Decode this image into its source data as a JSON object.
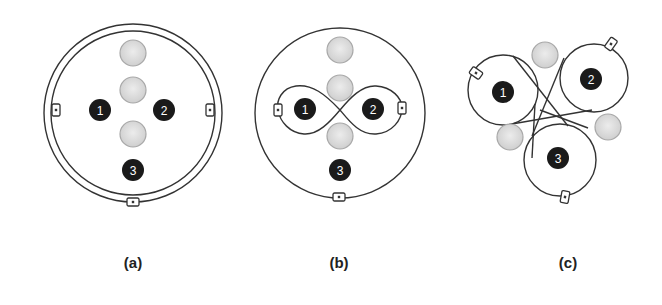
{
  "figure": {
    "panels": [
      {
        "id": "a",
        "caption": "(a)",
        "caption_pos": [
          133,
          262
        ],
        "outer_ring": {
          "cx": 133,
          "cy": 113,
          "r_outer": 89,
          "r_inner": 82
        },
        "gray_circles": [
          [
            133,
            53
          ],
          [
            133,
            90
          ],
          [
            133,
            134
          ]
        ],
        "black_nodes": [
          {
            "label": "1",
            "x": 100,
            "y": 110
          },
          {
            "label": "2",
            "x": 164,
            "y": 110
          },
          {
            "label": "3",
            "x": 133,
            "y": 170
          }
        ],
        "connectors": [
          [
            56,
            110,
            0
          ],
          [
            210,
            110,
            0
          ],
          [
            133,
            202,
            90
          ]
        ]
      },
      {
        "id": "b",
        "caption": "(b)",
        "caption_pos": [
          339,
          262
        ],
        "outer_ring": {
          "cx": 340,
          "cy": 113,
          "r": 85
        },
        "gray_circles": [
          [
            340,
            50
          ],
          [
            340,
            88
          ],
          [
            340,
            136
          ]
        ],
        "black_nodes": [
          {
            "label": "1",
            "x": 305,
            "y": 109
          },
          {
            "label": "2",
            "x": 373,
            "y": 109
          },
          {
            "label": "3",
            "x": 340,
            "y": 170
          }
        ],
        "connectors": [
          [
            278,
            110,
            0
          ],
          [
            402,
            108,
            0
          ],
          [
            339,
            197,
            90
          ]
        ]
      },
      {
        "id": "c",
        "caption": "(c)",
        "caption_pos": [
          568,
          262
        ],
        "gray_circles": [
          [
            545,
            55
          ],
          [
            510,
            137
          ],
          [
            608,
            127
          ]
        ],
        "black_nodes": [
          {
            "label": "1",
            "x": 503,
            "y": 92
          },
          {
            "label": "2",
            "x": 591,
            "y": 79
          },
          {
            "label": "3",
            "x": 558,
            "y": 158
          }
        ],
        "connectors": [
          [
            476,
            73,
            -55
          ],
          [
            611,
            44,
            35
          ],
          [
            565,
            197,
            10
          ]
        ]
      }
    ],
    "colors": {
      "line": "#333333",
      "black_node": "#1a1a1a",
      "gray_fill": "#d8d8d8",
      "gray_stroke": "#a8a8a8"
    }
  }
}
